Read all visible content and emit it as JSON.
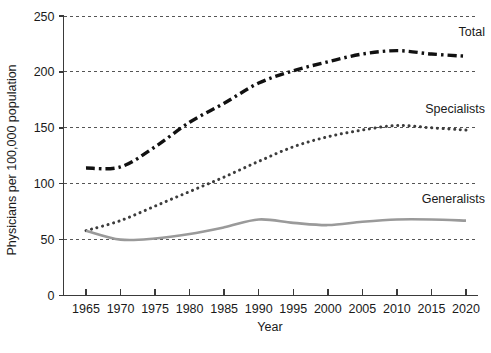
{
  "chart_data": {
    "type": "line",
    "title": "",
    "xlabel": "Year",
    "ylabel": "Physicians per 100,000 population",
    "x": [
      1965,
      1970,
      1975,
      1980,
      1985,
      1990,
      1995,
      2000,
      2005,
      2010,
      2015,
      2020
    ],
    "xlim": [
      1963,
      2022
    ],
    "ylim": [
      0,
      250
    ],
    "xticks": [
      "1965",
      "1970",
      "1975",
      "1980",
      "1985",
      "1990",
      "1995",
      "2000",
      "2005",
      "2010",
      "2015",
      "2020"
    ],
    "yticks": [
      "0",
      "50",
      "100",
      "150",
      "200",
      "250"
    ],
    "grid": "horizontal-dashed",
    "legend_position": "inline-right-labels",
    "series": [
      {
        "name": "Total",
        "label": "Total",
        "style": "dash-dot",
        "color": "#111111",
        "width": 3.4,
        "values": [
          114,
          115,
          133,
          155,
          172,
          190,
          201,
          209,
          216,
          219,
          216,
          214
        ]
      },
      {
        "name": "Specialists",
        "label": "Specialists",
        "style": "dotted",
        "color": "#3c3c3c",
        "width": 3.0,
        "values": [
          58,
          67,
          80,
          93,
          106,
          120,
          133,
          142,
          148,
          152,
          150,
          148
        ]
      },
      {
        "name": "Generalists",
        "label": "Generalists",
        "style": "solid",
        "color": "#9a9a9a",
        "width": 2.6,
        "values": [
          58,
          50,
          51,
          55,
          61,
          68,
          65,
          63,
          66,
          68,
          68,
          67
        ]
      }
    ],
    "annotations": [
      {
        "text": "Total",
        "x": 2021,
        "y": 232
      },
      {
        "text": "Specialists",
        "x": 2021,
        "y": 163
      },
      {
        "text": "Generalists",
        "x": 2021,
        "y": 83
      }
    ]
  }
}
